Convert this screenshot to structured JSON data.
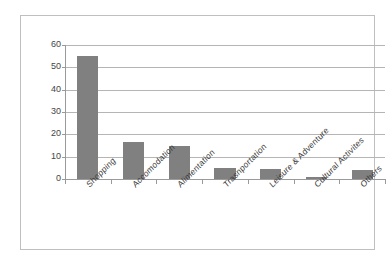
{
  "chart_data": {
    "type": "bar",
    "title": "",
    "subtitle": "",
    "xlabel": "",
    "ylabel": "",
    "categories": [
      "Shopping",
      "Accomodation",
      "Alimentation",
      "Trasnportation",
      "Leisure & Adventure",
      "Cultural Activites",
      "Others"
    ],
    "values": [
      55,
      16.5,
      15,
      5,
      4.5,
      1,
      4
    ],
    "series": [
      {
        "name": "Expenditure share",
        "values": [
          55,
          16.5,
          15,
          5,
          4.5,
          1,
          4
        ]
      }
    ],
    "ylim": [
      0,
      60
    ],
    "yticks": [
      0,
      10,
      20,
      30,
      40,
      50,
      60
    ],
    "ytick_labels": [
      "0",
      "10",
      "20",
      "30",
      "40",
      "50",
      "60"
    ],
    "grid": true,
    "grid_axis": "y",
    "legend": false,
    "legend_position": "none",
    "bar_color": "#808080",
    "gridline_color": "#b5b5b5",
    "axis_color": "#9a9a9a",
    "frame_color": "#bfbfbf",
    "background_color": "#ffffff",
    "label_rotation": -45
  }
}
